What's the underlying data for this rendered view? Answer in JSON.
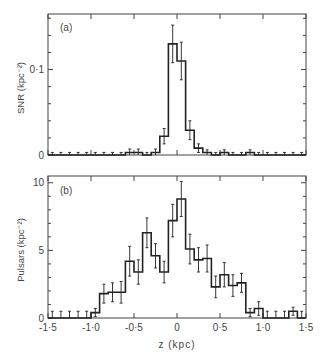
{
  "chart_data": [
    {
      "type": "bar",
      "panel_label": "(a)",
      "title": "",
      "xlabel": "",
      "ylabel": "SNR (kpc⁻²)",
      "xlim": [
        -1.5,
        1.5
      ],
      "ylim": [
        0,
        0.165
      ],
      "bin_width": 0.1,
      "y_ticks": [
        {
          "v": 0,
          "label": "0"
        },
        {
          "v": 0.1,
          "label": "0·1"
        }
      ],
      "x": [
        -1.45,
        -1.35,
        -1.25,
        -1.15,
        -1.05,
        -0.95,
        -0.85,
        -0.75,
        -0.65,
        -0.55,
        -0.45,
        -0.35,
        -0.25,
        -0.15,
        -0.05,
        0.05,
        0.15,
        0.25,
        0.35,
        0.45,
        0.55,
        0.65,
        0.75,
        0.85,
        0.95,
        1.05,
        1.15,
        1.25,
        1.35,
        1.45
      ],
      "values": [
        0,
        0,
        0,
        0,
        0,
        0,
        0,
        0,
        0,
        0.003,
        0.003,
        0,
        0.003,
        0.022,
        0.13,
        0.11,
        0.029,
        0.008,
        0.003,
        0,
        0.003,
        0,
        0,
        0.003,
        0,
        0,
        0,
        0,
        0,
        0
      ],
      "errors": [
        0.003,
        0.003,
        0.003,
        0.003,
        0.003,
        0.003,
        0.003,
        0.003,
        0.003,
        0.004,
        0.004,
        0.003,
        0.004,
        0.009,
        0.022,
        0.022,
        0.011,
        0.005,
        0.003,
        0.003,
        0.003,
        0.003,
        0.003,
        0.003,
        0.003,
        0.003,
        0.003,
        0.003,
        0.003,
        0.003
      ],
      "grid": false
    },
    {
      "type": "bar",
      "panel_label": "(b)",
      "title": "",
      "xlabel": "z (kpc)",
      "ylabel": "Pulsars (kpc⁻²)",
      "xlim": [
        -1.5,
        1.5
      ],
      "ylim": [
        0,
        10.5
      ],
      "bin_width": 0.1,
      "y_ticks": [
        {
          "v": 0,
          "label": "0"
        },
        {
          "v": 5,
          "label": "5"
        },
        {
          "v": 10,
          "label": "10"
        }
      ],
      "x_ticks": [
        {
          "v": -1.5,
          "label": "-1·5"
        },
        {
          "v": -1.0,
          "label": "-1·0"
        },
        {
          "v": -0.5,
          "label": "-0·5"
        },
        {
          "v": 0,
          "label": "0"
        },
        {
          "v": 0.5,
          "label": "0·5"
        },
        {
          "v": 1.0,
          "label": "1·0"
        },
        {
          "v": 1.5,
          "label": "1·5"
        }
      ],
      "x": [
        -1.45,
        -1.35,
        -1.25,
        -1.15,
        -1.05,
        -0.95,
        -0.85,
        -0.75,
        -0.65,
        -0.55,
        -0.45,
        -0.35,
        -0.25,
        -0.15,
        -0.05,
        0.05,
        0.15,
        0.25,
        0.35,
        0.45,
        0.55,
        0.65,
        0.75,
        0.85,
        0.95,
        1.05,
        1.15,
        1.25,
        1.35,
        1.45
      ],
      "values": [
        0,
        0,
        0,
        0,
        0,
        0.4,
        1.8,
        1.9,
        1.9,
        4.2,
        3.4,
        6.3,
        4.6,
        3.4,
        7.2,
        8.8,
        5.1,
        4.3,
        4.4,
        2.3,
        3.2,
        2.4,
        2.6,
        0.4,
        0.7,
        0,
        0,
        0,
        0.5,
        0
      ],
      "errors": [
        0.5,
        0.5,
        0.5,
        0.5,
        0.5,
        0.3,
        0.7,
        0.7,
        0.8,
        1.1,
        0.9,
        1.1,
        0.9,
        0.8,
        1.2,
        1.3,
        1.1,
        0.9,
        1.0,
        0.8,
        0.9,
        0.8,
        0.7,
        0.3,
        0.5,
        0.5,
        0.5,
        0.5,
        0.3,
        0.5
      ],
      "grid": false
    }
  ],
  "labels": {
    "panel_a": "(a)",
    "panel_b": "(b)",
    "ylabel_a": "SNR (kpc⁻²)",
    "ylabel_b": "Pulsars (kpc⁻²)",
    "xlabel": "z (kpc)"
  },
  "colors": {
    "line": "#222222",
    "axis": "#444444",
    "text": "#444444"
  }
}
